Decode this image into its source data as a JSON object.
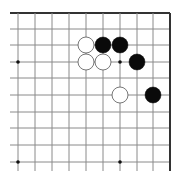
{
  "board": {
    "title": "Go board position (top-right corner section)",
    "background": "#ffffff",
    "line_color": "#8a8a8a",
    "edge_color": "#333333",
    "columns_x": [
      18,
      35,
      52,
      69,
      86,
      103,
      120,
      137,
      153,
      170
    ],
    "rows_y": [
      13,
      29,
      45,
      62,
      78,
      95,
      112,
      128,
      145,
      162
    ],
    "stone_radius": 8,
    "star_points": [
      {
        "col": 0,
        "row": 3
      },
      {
        "col": 6,
        "row": 3
      },
      {
        "col": 0,
        "row": 9
      },
      {
        "col": 6,
        "row": 9
      }
    ],
    "stones": [
      {
        "color": "white",
        "col": 4,
        "row": 2
      },
      {
        "color": "black",
        "col": 5,
        "row": 2
      },
      {
        "color": "black",
        "col": 6,
        "row": 2
      },
      {
        "color": "white",
        "col": 4,
        "row": 3
      },
      {
        "color": "white",
        "col": 5,
        "row": 3
      },
      {
        "color": "black",
        "col": 7,
        "row": 3
      },
      {
        "color": "white",
        "col": 6,
        "row": 5
      },
      {
        "color": "black",
        "col": 8,
        "row": 5
      }
    ],
    "colors": {
      "black_stone": "#0a0a0a",
      "white_stone": "#ffffff",
      "white_stone_outline": "#555555"
    }
  }
}
